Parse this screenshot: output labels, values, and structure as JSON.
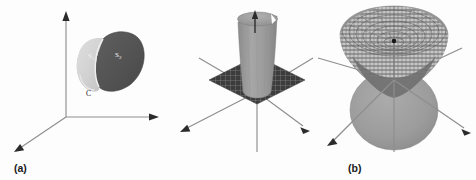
{
  "figure": {
    "background_color": "#fdfdfd",
    "panel_count": 3,
    "caption_a": "(a)",
    "caption_b": "(b)",
    "caption_c": "(c)"
  },
  "panel_a": {
    "name": "closed-surface-split-into-two-caps",
    "label_s1": "S",
    "label_s1_sub": "1",
    "label_s2": "S",
    "label_s2_sub": "2",
    "label_c": "C",
    "light_surface_color": "#d2d2d2",
    "dark_surface_color": "#555555",
    "axis_color": "#8e8e8e",
    "arrow_color": "#2b2b2b",
    "axes": [
      "vertical-up",
      "horizontal-right",
      "diagonal-down-left"
    ]
  },
  "panel_b": {
    "name": "upward-opening-cone-over-grid-plane",
    "surface_color": "#9a9a9a",
    "plane_color": "#3c3c3c",
    "grid_color": "#8a8a8a",
    "axis_color": "#8e8e8e",
    "arrow_color": "#2b2b2b",
    "inner_arrow": "normal-vector-arrow",
    "axes": [
      "up-left",
      "up-right",
      "down-left",
      "down-right",
      "vertical-down"
    ]
  },
  "panel_c": {
    "name": "mesh-cone-and-solid-sphere",
    "mesh_surface_color": "#b8b8b8",
    "mesh_line_color": "#5a5a5a",
    "sphere_color": "#9c9c9c",
    "cone_inner_color": "#6e6e6e",
    "axis_color": "#8e8e8e",
    "arrow_color": "#2b2b2b",
    "center_marker": "center-point",
    "axes": [
      "up-right",
      "left",
      "down-left",
      "down-right",
      "vertical-down"
    ]
  }
}
